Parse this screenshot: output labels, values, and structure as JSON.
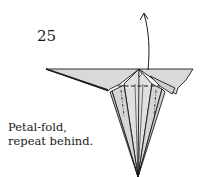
{
  "diagram": {
    "step_number": "25",
    "caption_line1": "Petal-fold,",
    "caption_line2": "repeat behind.",
    "colors": {
      "paper": "#d9d9d9",
      "line": "#1a1a1a",
      "background": "#ffffff"
    }
  }
}
